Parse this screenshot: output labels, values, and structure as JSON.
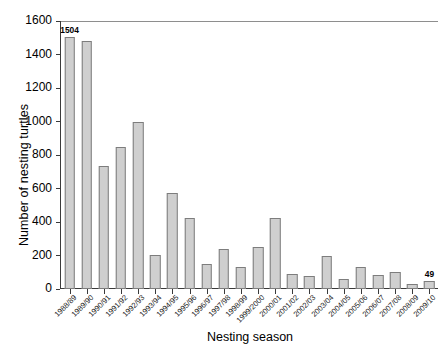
{
  "chart_data": {
    "type": "bar",
    "title": "",
    "xlabel": "Nesting season",
    "ylabel": "Number of nesting turtles",
    "ylim": [
      0,
      1600
    ],
    "yticks": [
      0,
      200,
      400,
      600,
      800,
      1000,
      1200,
      1400,
      1600
    ],
    "grid": false,
    "legend": null,
    "bar_color": "#cfcfcf",
    "bar_edge_color": "#7d7d7d",
    "annotations": [
      {
        "category": "1988/89",
        "value": 1504,
        "text": "1504"
      },
      {
        "category": "2009/10",
        "value": 49,
        "text": "49"
      }
    ],
    "categories": [
      "1988/89",
      "1989/90",
      "1990/91",
      "1991/92",
      "1992/93",
      "1993/94",
      "1994/95",
      "1995/96",
      "1996/97",
      "1997/98",
      "1998/99",
      "1999/2000",
      "2000/01",
      "2001/02",
      "2002/03",
      "2003/04",
      "2004/05",
      "2005/06",
      "2006/07",
      "2007/08",
      "2008/09",
      "2009/10"
    ],
    "values": [
      1504,
      1478,
      735,
      848,
      1000,
      205,
      575,
      425,
      148,
      240,
      132,
      250,
      425,
      88,
      78,
      200,
      62,
      133,
      85,
      100,
      28,
      49
    ]
  }
}
